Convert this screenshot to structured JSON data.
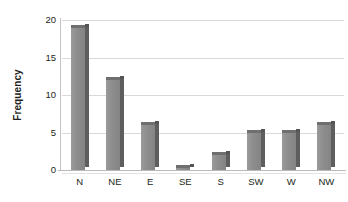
{
  "chart_data": {
    "type": "bar",
    "title": "",
    "xlabel": "",
    "ylabel": "Frequency",
    "categories": [
      "N",
      "NE",
      "E",
      "SE",
      "S",
      "SW",
      "W",
      "NW"
    ],
    "values": [
      19,
      12,
      6,
      0.3,
      2,
      5,
      5,
      6
    ],
    "ylim": [
      0,
      20
    ],
    "yticks": [
      0,
      5,
      10,
      15,
      20
    ],
    "ytick_labels": [
      "0",
      "5",
      "10",
      "15",
      "20"
    ],
    "grid": true,
    "legend": null,
    "bar_style": "3d-column",
    "colors": {
      "bar_face": "#8d8d8d",
      "bar_side": "#5e5e5e",
      "bar_top": "#6f6f6f",
      "gridline": "#d9d9d9",
      "background": "#ffffff",
      "text": "#231f20"
    }
  }
}
